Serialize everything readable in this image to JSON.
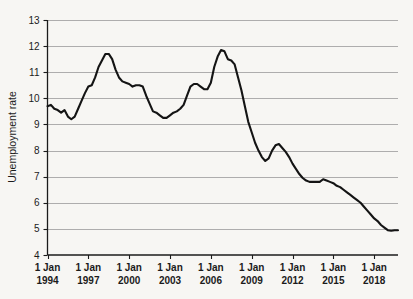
{
  "chart_data": {
    "type": "line",
    "title": "",
    "xlabel": "",
    "ylabel": "Unemployment rate",
    "ylim": [
      4,
      13
    ],
    "xlim": [
      1994.0,
      2019.75
    ],
    "grid": true,
    "legend": null,
    "y_ticks": [
      "13",
      "12",
      "11",
      "10",
      "9",
      "8",
      "7",
      "6",
      "5",
      "4"
    ],
    "y_tick_values": [
      13,
      12,
      11,
      10,
      9,
      8,
      7,
      6,
      5,
      4
    ],
    "x_ticks": [
      {
        "line1": "1 Jan",
        "line2": "1994",
        "value": 1994
      },
      {
        "line1": "1 Jan",
        "line2": "1997",
        "value": 1997
      },
      {
        "line1": "1 Jan",
        "line2": "2000",
        "value": 2000
      },
      {
        "line1": "1 Jan",
        "line2": "2003",
        "value": 2003
      },
      {
        "line1": "1 Jan",
        "line2": "2006",
        "value": 2006
      },
      {
        "line1": "1 Jan",
        "line2": "2009",
        "value": 2009
      },
      {
        "line1": "1 Jan",
        "line2": "2012",
        "value": 2012
      },
      {
        "line1": "1 Jan",
        "line2": "2015",
        "value": 2015
      },
      {
        "line1": "1 Jan",
        "line2": "2018",
        "value": 2018
      }
    ],
    "line_color": "#141414",
    "grid_color": "#9a9a9a",
    "background_color": "#f7f6f3",
    "series": [
      {
        "name": "Unemployment rate",
        "x": [
          1994.0,
          1994.25,
          1994.5,
          1994.75,
          1995.0,
          1995.25,
          1995.5,
          1995.75,
          1996.0,
          1996.25,
          1996.5,
          1996.75,
          1997.0,
          1997.25,
          1997.5,
          1997.75,
          1998.0,
          1998.25,
          1998.5,
          1998.75,
          1999.0,
          1999.25,
          1999.5,
          1999.75,
          2000.0,
          2000.25,
          2000.5,
          2000.75,
          2001.0,
          2001.25,
          2001.5,
          2001.75,
          2002.0,
          2002.25,
          2002.5,
          2002.75,
          2003.0,
          2003.25,
          2003.5,
          2003.75,
          2004.0,
          2004.25,
          2004.5,
          2004.75,
          2005.0,
          2005.25,
          2005.5,
          2005.75,
          2006.0,
          2006.25,
          2006.5,
          2006.75,
          2007.0,
          2007.25,
          2007.5,
          2007.75,
          2008.0,
          2008.25,
          2008.5,
          2008.75,
          2009.0,
          2009.25,
          2009.5,
          2009.75,
          2010.0,
          2010.25,
          2010.5,
          2010.75,
          2011.0,
          2011.25,
          2011.5,
          2011.75,
          2012.0,
          2012.25,
          2012.5,
          2012.75,
          2013.0,
          2013.25,
          2013.5,
          2013.75,
          2014.0,
          2014.25,
          2014.5,
          2014.75,
          2015.0,
          2015.25,
          2015.5,
          2015.75,
          2016.0,
          2016.25,
          2016.5,
          2016.75,
          2017.0,
          2017.25,
          2017.5,
          2017.75,
          2018.0,
          2018.25,
          2018.5,
          2018.75,
          2019.0,
          2019.25,
          2019.5,
          2019.75
        ],
        "values": [
          9.7,
          9.75,
          9.6,
          9.55,
          9.45,
          9.55,
          9.3,
          9.2,
          9.3,
          9.6,
          9.9,
          10.2,
          10.45,
          10.5,
          10.8,
          11.2,
          11.45,
          11.7,
          11.7,
          11.5,
          11.1,
          10.8,
          10.65,
          10.6,
          10.55,
          10.45,
          10.5,
          10.5,
          10.45,
          10.1,
          9.8,
          9.5,
          9.45,
          9.35,
          9.25,
          9.25,
          9.35,
          9.45,
          9.5,
          9.6,
          9.75,
          10.1,
          10.45,
          10.55,
          10.55,
          10.45,
          10.35,
          10.35,
          10.6,
          11.2,
          11.6,
          11.85,
          11.8,
          11.5,
          11.45,
          11.3,
          10.8,
          10.3,
          9.7,
          9.1,
          8.7,
          8.3,
          8.0,
          7.75,
          7.6,
          7.7,
          8.0,
          8.2,
          8.25,
          8.1,
          7.95,
          7.75,
          7.5,
          7.3,
          7.1,
          6.95,
          6.85,
          6.8,
          6.8,
          6.8,
          6.8,
          6.9,
          6.85,
          6.8,
          6.75,
          6.65,
          6.6,
          6.5,
          6.4,
          6.3,
          6.2,
          6.1,
          6.0,
          5.85,
          5.7,
          5.55,
          5.4,
          5.3,
          5.15,
          5.05,
          4.95,
          4.93,
          4.95,
          4.95
        ]
      }
    ],
    "annotations": []
  },
  "figure": {
    "y_axis_title": "Unemployment rate",
    "bleed_text": ""
  }
}
